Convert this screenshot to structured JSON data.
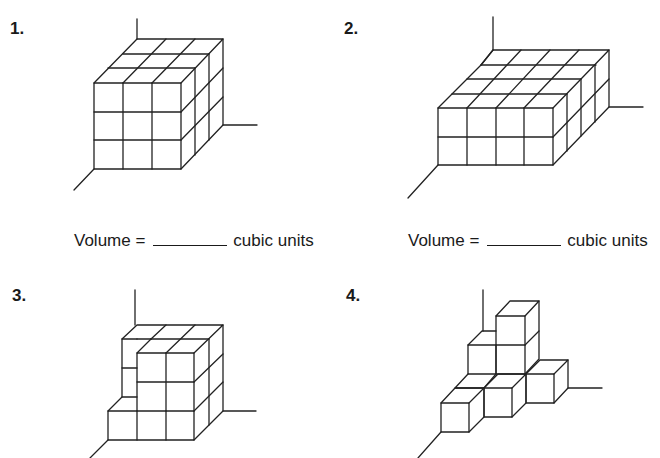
{
  "problems": [
    {
      "number": "1.",
      "answer_prompt": {
        "label": "Volume =",
        "blank": "",
        "units": "cubic units"
      },
      "figure": {
        "shape": "rectangular prism of unit cubes",
        "width": 3,
        "height": 3,
        "depth": 3
      }
    },
    {
      "number": "2.",
      "answer_prompt": {
        "label": "Volume =",
        "blank": "",
        "units": "cubic units"
      },
      "figure": {
        "shape": "rectangular prism of unit cubes",
        "width": 4,
        "height": 2,
        "depth": 3
      }
    },
    {
      "number": "3.",
      "figure": {
        "shape": "3x3x3 prism with front-left column of upper two cubes removed"
      }
    },
    {
      "number": "4.",
      "figure": {
        "shape": "staircase arrangement of unit cubes"
      }
    }
  ],
  "colors": {
    "line": "#222222",
    "text": "#1a1a1a",
    "background": "#ffffff"
  }
}
